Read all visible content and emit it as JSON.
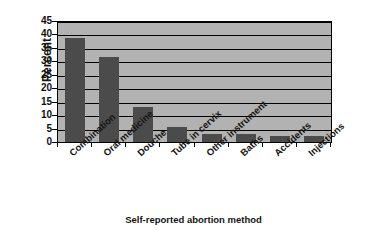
{
  "chart_data": {
    "type": "bar",
    "title": "",
    "xlabel": "Self-reported abortion method",
    "ylabel": "Percent",
    "categories": [
      "Combination",
      "Oral medicine",
      "Douche",
      "Tube in cervix",
      "Other instrument",
      "Baths",
      "Accidents",
      "Injections"
    ],
    "values": [
      39,
      32,
      13.5,
      6,
      3.5,
      3.5,
      2.5,
      2.5
    ],
    "ylim": [
      0,
      45
    ],
    "ytick_step": 5,
    "yticks": [
      45,
      40,
      35,
      30,
      25,
      20,
      15,
      10,
      5,
      0
    ],
    "grid": "horizontal",
    "legend": "none",
    "bar_color": "#4b4b4b",
    "plot_background": "#b2b2b2",
    "axis_color": "#000000"
  },
  "axes": {
    "y_title": "Percent",
    "x_title": "Self-reported abortion method"
  }
}
